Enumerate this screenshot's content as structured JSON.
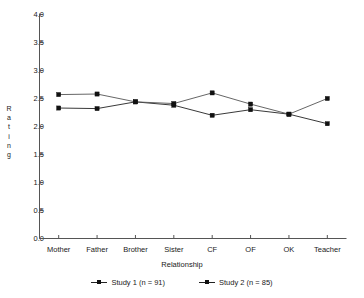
{
  "chart_data": {
    "type": "line",
    "title": "",
    "subtitle": "",
    "xlabel": "Relationship",
    "ylabel": "Rating",
    "categories": [
      "Mother",
      "Father",
      "Brother",
      "Sister",
      "CF",
      "OF",
      "OK",
      "Teacher"
    ],
    "series": [
      {
        "name": "Study 1 (n = 91)",
        "values": [
          2.33,
          2.32,
          2.44,
          2.38,
          2.2,
          2.3,
          2.22,
          2.05
        ],
        "color": "#222222",
        "marker": "square"
      },
      {
        "name": "Study 2 (n = 85)",
        "values": [
          2.57,
          2.58,
          2.44,
          2.41,
          2.6,
          2.4,
          2.22,
          2.5
        ],
        "color": "#555555",
        "marker": "square"
      }
    ],
    "ylim": [
      0.0,
      4.0
    ],
    "ytick_values": [
      0.0,
      0.5,
      1.0,
      1.5,
      2.0,
      2.5,
      3.0,
      3.5,
      4.0
    ],
    "ytick_labels": [
      "0.0",
      "0.5",
      "1.0",
      "1.5",
      "2.0",
      "2.5",
      "3.0",
      "3.5",
      "4.0"
    ],
    "grid": false,
    "legend_position": "bottom",
    "axes": {
      "left_spine": true,
      "bottom_spine": true,
      "top_spine": false,
      "right_spine": false
    }
  },
  "legend": {
    "entries": [
      {
        "label": "Study 1 (n = 91)"
      },
      {
        "label": "Study 2 (n = 85)"
      }
    ]
  },
  "axis_titles": {
    "y_letters": [
      "R",
      "a",
      "t",
      "i",
      "n",
      "g"
    ],
    "y_text": "Rating",
    "x_text": "Relationship"
  }
}
